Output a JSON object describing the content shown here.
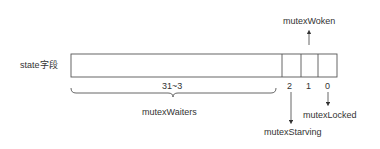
{
  "diagram": {
    "field_label": "state字段",
    "bit_range_label": "31~3",
    "bits": [
      {
        "index": "2",
        "name": "mutexStarving"
      },
      {
        "index": "1",
        "name": "mutexWoken"
      },
      {
        "index": "0",
        "name": "mutexLocked"
      }
    ],
    "waiters_label": "mutexWaiters"
  }
}
